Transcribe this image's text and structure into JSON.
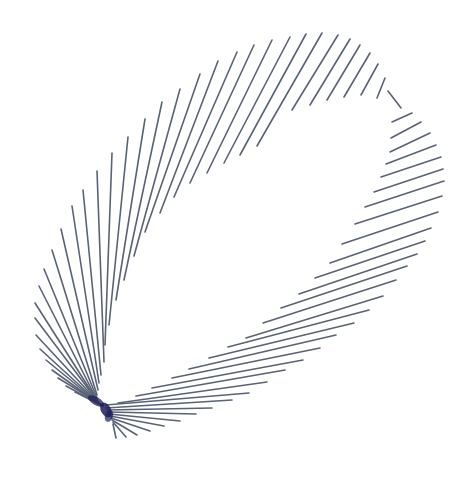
{
  "figure": {
    "title": "",
    "background": "#ffffff",
    "stroke_color": "#5a6275",
    "dense_color": "#1e1f5a",
    "stroke_width": 1.6
  },
  "chart_data": {
    "type": "line-art",
    "pinch_point": [
      100,
      405
    ],
    "segments": [
      [
        [
          322,
          33
        ],
        [
          257,
          146
        ]
      ],
      [
        [
          306,
          34
        ],
        [
          240,
          155
        ]
      ],
      [
        [
          290,
          37
        ],
        [
          224,
          163
        ]
      ],
      [
        [
          272,
          40
        ],
        [
          207,
          173
        ]
      ],
      [
        [
          254,
          45
        ],
        [
          190,
          183
        ]
      ],
      [
        [
          237,
          52
        ],
        [
          174,
          197
        ]
      ],
      [
        [
          218,
          61
        ],
        [
          160,
          213
        ]
      ],
      [
        [
          200,
          74
        ],
        [
          145,
          232
        ]
      ],
      [
        [
          180,
          89
        ],
        [
          134,
          256
        ]
      ],
      [
        [
          162,
          102
        ],
        [
          124,
          280
        ]
      ],
      [
        [
          145,
          119
        ],
        [
          116,
          300
        ]
      ],
      [
        [
          128,
          137
        ],
        [
          109,
          325
        ]
      ],
      [
        [
          112,
          153
        ],
        [
          105,
          345
        ]
      ],
      [
        [
          97,
          171
        ],
        [
          104,
          362
        ]
      ],
      [
        [
          83,
          190
        ],
        [
          101,
          375
        ]
      ],
      [
        [
          72,
          206
        ],
        [
          99,
          383
        ]
      ],
      [
        [
          61,
          229
        ],
        [
          98,
          390
        ]
      ],
      [
        [
          52,
          250
        ],
        [
          97,
          395
        ]
      ],
      [
        [
          44,
          269
        ],
        [
          97,
          398
        ]
      ],
      [
        [
          39,
          286
        ],
        [
          97,
          400
        ]
      ],
      [
        [
          35,
          303
        ],
        [
          98,
          402
        ]
      ],
      [
        [
          35,
          318
        ],
        [
          99,
          403
        ]
      ],
      [
        [
          36,
          335
        ],
        [
          100,
          404
        ]
      ],
      [
        [
          40,
          349
        ],
        [
          100,
          404
        ]
      ],
      [
        [
          46,
          360
        ],
        [
          101,
          405
        ]
      ],
      [
        [
          52,
          370
        ],
        [
          101,
          405
        ]
      ],
      [
        [
          58,
          378
        ],
        [
          102,
          405
        ]
      ],
      [
        [
          66,
          386
        ],
        [
          103,
          406
        ]
      ],
      [
        [
          75,
          392
        ],
        [
          103,
          406
        ]
      ],
      [
        [
          338,
          35
        ],
        [
          292,
          110
        ]
      ],
      [
        [
          350,
          39
        ],
        [
          310,
          105
        ]
      ],
      [
        [
          360,
          45
        ],
        [
          327,
          100
        ]
      ],
      [
        [
          370,
          53
        ],
        [
          344,
          97
        ]
      ],
      [
        [
          378,
          64
        ],
        [
          361,
          95
        ]
      ],
      [
        [
          385,
          78
        ],
        [
          377,
          98
        ]
      ],
      [
        [
          388,
          91
        ],
        [
          401,
          108
        ]
      ],
      [
        [
          412,
          113
        ],
        [
          392,
          122
        ]
      ],
      [
        [
          421,
          122
        ],
        [
          391,
          138
        ]
      ],
      [
        [
          430,
          133
        ],
        [
          390,
          152
        ]
      ],
      [
        [
          436,
          145
        ],
        [
          386,
          164
        ]
      ],
      [
        [
          441,
          157
        ],
        [
          381,
          177
        ]
      ],
      [
        [
          443,
          169
        ],
        [
          374,
          192
        ]
      ],
      [
        [
          444,
          181
        ],
        [
          365,
          207
        ]
      ],
      [
        [
          442,
          196
        ],
        [
          355,
          224
        ]
      ],
      [
        [
          438,
          212
        ],
        [
          342,
          244
        ]
      ],
      [
        [
          431,
          228
        ],
        [
          330,
          263
        ]
      ],
      [
        [
          425,
          241
        ],
        [
          315,
          278
        ]
      ],
      [
        [
          417,
          254
        ],
        [
          299,
          294
        ]
      ],
      [
        [
          407,
          266
        ],
        [
          281,
          308
        ]
      ],
      [
        [
          396,
          280
        ],
        [
          263,
          323
        ]
      ],
      [
        [
          383,
          296
        ],
        [
          246,
          338
        ]
      ],
      [
        [
          369,
          310
        ],
        [
          228,
          347
        ]
      ],
      [
        [
          354,
          323
        ],
        [
          209,
          358
        ]
      ],
      [
        [
          336,
          335
        ],
        [
          189,
          369
        ]
      ],
      [
        [
          320,
          348
        ],
        [
          172,
          378
        ]
      ],
      [
        [
          303,
          360
        ],
        [
          152,
          388
        ]
      ],
      [
        [
          285,
          370
        ],
        [
          136,
          396
        ]
      ],
      [
        [
          267,
          382
        ],
        [
          118,
          403
        ]
      ],
      [
        [
          249,
          393
        ],
        [
          106,
          405
        ]
      ],
      [
        [
          232,
          400
        ],
        [
          106,
          408
        ]
      ],
      [
        [
          212,
          408
        ],
        [
          107,
          410
        ]
      ],
      [
        [
          196,
          414
        ],
        [
          108,
          412
        ]
      ],
      [
        [
          180,
          421
        ],
        [
          109,
          414
        ]
      ],
      [
        [
          164,
          426
        ],
        [
          110,
          416
        ]
      ],
      [
        [
          150,
          431
        ],
        [
          111,
          418
        ]
      ],
      [
        [
          137,
          435
        ],
        [
          112,
          420
        ]
      ],
      [
        [
          126,
          437
        ],
        [
          113,
          422
        ]
      ],
      [
        [
          116,
          438
        ],
        [
          113,
          424
        ]
      ]
    ]
  }
}
